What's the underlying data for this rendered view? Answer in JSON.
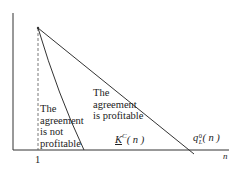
{
  "diagram": {
    "type": "profitability-regions",
    "axes": {
      "x_label": "n",
      "x_tick_label": "1"
    },
    "curves": [
      {
        "id": "K_C",
        "label_main": "K",
        "label_sup": "C",
        "label_arg": "( n )",
        "description": "steep boundary curve"
      },
      {
        "id": "q_L0",
        "label_main": "q",
        "label_sup": "0",
        "label_sub": "L",
        "label_arg": "( n )",
        "description": "shallow boundary line"
      }
    ],
    "regions": {
      "left": [
        "The",
        "agreement",
        "is not",
        "profitable"
      ],
      "middle": [
        "The",
        "agreement",
        "is profitable"
      ]
    },
    "colors": {
      "line": "#333333",
      "background": "#ffffff"
    }
  }
}
